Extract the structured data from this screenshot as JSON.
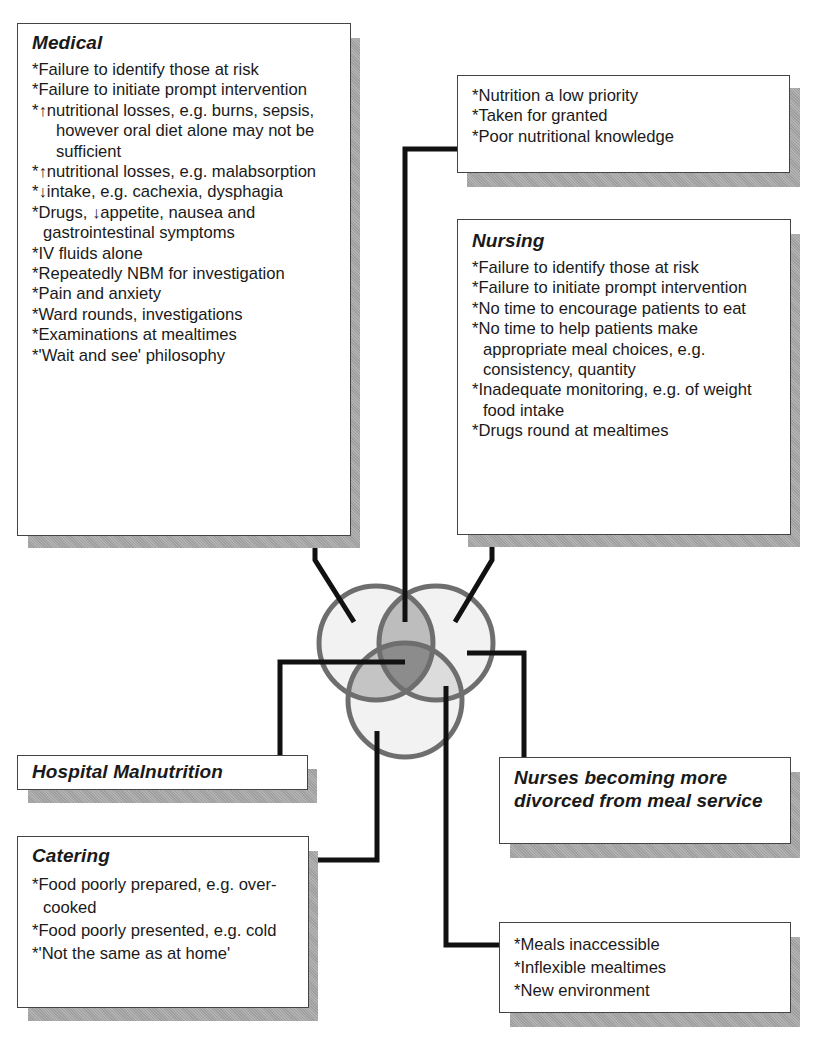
{
  "diagram": {
    "type": "venn-cause-diagram",
    "colors": {
      "circle_stroke": "#6e6e6e",
      "overlap_two": "#b8b8b8",
      "overlap_three": "#8a8a8a",
      "circle_fill": "#f0f0f0",
      "connector": "#111111",
      "shadow": "#a9a9a9"
    },
    "medical": {
      "title": "Medical",
      "items": [
        "*Failure to identify those at risk",
        "*Failure to initiate prompt intervention",
        "*↑nutritional losses, e.g. burns, sepsis, however oral diet alone may not be sufficient",
        "*↑nutritional losses, e.g. malabsorption",
        "*↓intake, e.g. cachexia, dysphagia",
        "*Drugs, ↓appetite, nausea and gastrointestinal symptoms",
        "*IV fluids alone",
        "*Repeatedly NBM for investigation",
        "*Pain and anxiety",
        "*Ward rounds, investigations",
        "*Examinations at mealtimes",
        "*'Wait and see' philosophy"
      ]
    },
    "priority": {
      "items": [
        "*Nutrition a low priority",
        "*Taken for granted",
        "*Poor nutritional knowledge"
      ]
    },
    "nursing": {
      "title": "Nursing",
      "items": [
        "*Failure to identify those at risk",
        "*Failure to initiate prompt intervention",
        "*No time to encourage patients to eat",
        "*No time to help patients make appropriate meal choices, e.g. consistency, quantity",
        "*Inadequate monitoring, e.g. of weight food intake",
        "*Drugs round at mealtimes"
      ]
    },
    "hospital_malnutrition": {
      "title": "Hospital Malnutrition"
    },
    "nurses_divorced": {
      "title": "Nurses becoming more divorced from meal service"
    },
    "catering": {
      "title": "Catering",
      "items": [
        "*Food poorly prepared, e.g. over-cooked",
        "*Food poorly presented, e.g. cold",
        "*'Not the same as at home'"
      ]
    },
    "environment": {
      "items": [
        "*Meals inaccessible",
        "*Inflexible mealtimes",
        "*New environment"
      ]
    }
  }
}
